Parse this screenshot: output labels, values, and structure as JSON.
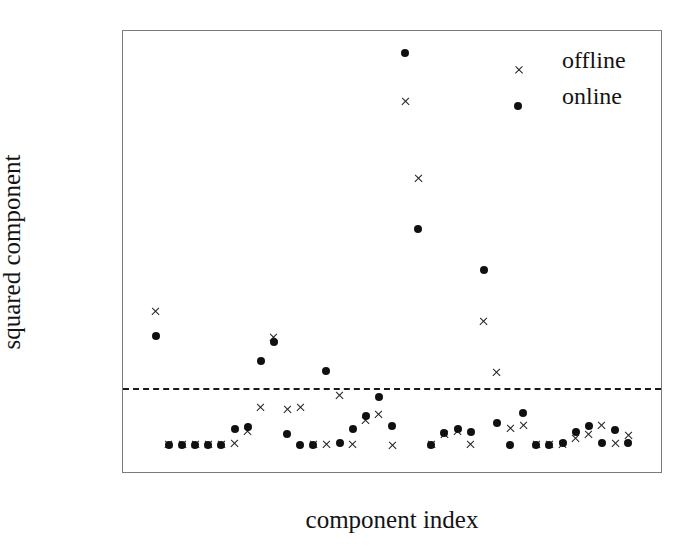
{
  "chart_data": {
    "type": "scatter",
    "title": "",
    "xlabel": "component index",
    "ylabel": "squared component",
    "xlim": [
      -1.5,
      39.5
    ],
    "ylim": [
      -0.018,
      0.2875
    ],
    "grid": false,
    "legend_position": "upper right",
    "xticks": [
      0,
      10,
      20,
      30
    ],
    "xtick_labels": [
      "0",
      "10",
      "20",
      "30"
    ],
    "yticks": [
      0.0,
      0.05,
      0.1,
      0.15,
      0.2,
      0.25
    ],
    "ytick_labels": [
      "0.00",
      "0.05",
      "0.10",
      "0.15",
      "0.20",
      "0.25"
    ],
    "annotations": [
      {
        "name": "threshold",
        "type": "hline",
        "y": 0.04,
        "style": "dashed",
        "color": "#1a1a1a"
      }
    ],
    "x": [
      1,
      2,
      3,
      4,
      5,
      6,
      7,
      8,
      9,
      10,
      11,
      12,
      13,
      14,
      15,
      16,
      17,
      18,
      19,
      20,
      21,
      22,
      23,
      24,
      25,
      26,
      27,
      28,
      29,
      30,
      31,
      32,
      33,
      34,
      35,
      36,
      37
    ],
    "series": [
      {
        "name": "offline",
        "marker": "x",
        "color": "#202020",
        "values": [
          0.093,
          0.001,
          0.001,
          0.001,
          0.001,
          0.001,
          0.002,
          0.01,
          0.027,
          0.075,
          0.025,
          0.027,
          0.001,
          0.001,
          0.035,
          0.001,
          0.018,
          0.022,
          0.0005,
          0.239,
          0.185,
          0.001,
          0.008,
          0.01,
          0.001,
          0.086,
          0.051,
          0.012,
          0.014,
          0.001,
          0.001,
          0.001,
          0.005,
          0.008,
          0.014,
          0.002,
          0.007
        ]
      },
      {
        "name": "online",
        "marker": "o",
        "color": "#101010",
        "values": [
          0.076,
          0.001,
          0.001,
          0.001,
          0.001,
          0.001,
          0.012,
          0.013,
          0.059,
          0.072,
          0.008,
          0.001,
          0.001,
          0.052,
          0.002,
          0.012,
          0.021,
          0.034,
          0.014,
          0.272,
          0.15,
          0.001,
          0.009,
          0.012,
          0.01,
          0.122,
          0.016,
          0.001,
          0.023,
          0.001,
          0.001,
          0.002,
          0.01,
          0.014,
          0.002,
          0.011,
          0.002
        ]
      }
    ]
  },
  "legend": {
    "items": [
      {
        "label": "offline",
        "marker": "x"
      },
      {
        "label": "online",
        "marker": "o"
      }
    ]
  }
}
